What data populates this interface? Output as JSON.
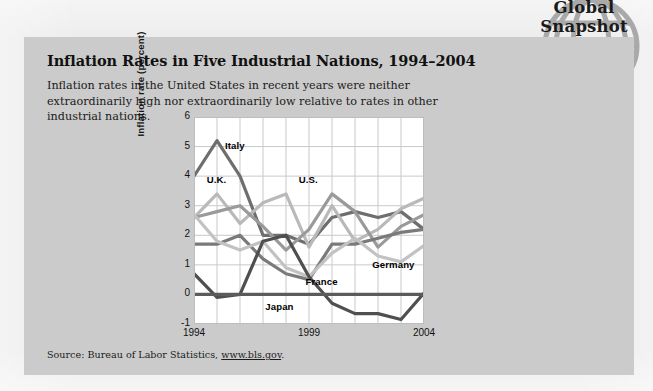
{
  "badge": {
    "line1": "Global",
    "line2": "Snapshot",
    "number": "12.5",
    "icon": "globe-icon",
    "color": "#a8a8a8"
  },
  "panel": {
    "title": "Inflation Rates in Five Industrial Nations, 1994–2004",
    "subtitle": "Inflation rates in the United States in recent years were neither extraordinarily high nor extraordinarily low relative to rates in other industrial nations.",
    "source_prefix": "Source: Bureau of Labor Statistics, ",
    "source_link": "www.bls.gov",
    "source_suffix": ".",
    "background": "#cbcbcb"
  },
  "chart_data": {
    "type": "line",
    "title": "Inflation Rates in Five Industrial Nations, 1994–2004",
    "xlabel": "",
    "ylabel": "Inflation rate (percent)",
    "x": [
      1994,
      1995,
      1996,
      1997,
      1998,
      1999,
      2000,
      2001,
      2002,
      2003,
      2004
    ],
    "xtick_labels": [
      "1994",
      "1999",
      "2004"
    ],
    "xtick_values": [
      1994,
      1999,
      2004
    ],
    "xlim": [
      1994,
      2004
    ],
    "ytick_labels": [
      "-1",
      "0",
      "1",
      "2",
      "3",
      "4",
      "5",
      "6"
    ],
    "ytick_values": [
      -1,
      0,
      1,
      2,
      3,
      4,
      5,
      6
    ],
    "ylim": [
      -1,
      6
    ],
    "grid": true,
    "legend": "inline-labels",
    "series": [
      {
        "name": "Italy",
        "color": "#6e6e6e",
        "width": 3.2,
        "label_x": 1995.35,
        "label_y": 5.0,
        "values": [
          4.0,
          5.2,
          4.0,
          2.0,
          2.0,
          1.7,
          2.6,
          2.8,
          2.6,
          2.8,
          2.2
        ]
      },
      {
        "name": "U.K.",
        "color": "#b9b9b9",
        "width": 3.2,
        "label_x": 1994.55,
        "label_y": 3.85,
        "values": [
          2.6,
          3.4,
          2.4,
          3.1,
          3.4,
          1.6,
          3.0,
          1.8,
          2.2,
          2.9,
          3.25
        ]
      },
      {
        "name": "U.S.",
        "color": "#9a9a9a",
        "width": 3.2,
        "label_x": 1998.55,
        "label_y": 3.85,
        "values": [
          2.6,
          2.8,
          3.0,
          2.3,
          1.5,
          2.2,
          3.4,
          2.8,
          1.6,
          2.3,
          2.7
        ]
      },
      {
        "name": "France",
        "color": "#7a7a7a",
        "width": 3.2,
        "label_x": 1998.85,
        "label_y": 0.38,
        "values": [
          1.7,
          1.7,
          2.0,
          1.2,
          0.7,
          0.5,
          1.7,
          1.7,
          1.9,
          2.1,
          2.2
        ]
      },
      {
        "name": "Germany",
        "color": "#c2c2c2",
        "width": 3.2,
        "label_x": 2001.75,
        "label_y": 0.95,
        "values": [
          2.7,
          1.8,
          1.5,
          1.8,
          0.9,
          0.6,
          1.4,
          1.9,
          1.3,
          1.1,
          1.65
        ]
      },
      {
        "name": "Japan",
        "color": "#4f4f4f",
        "width": 3.2,
        "label_x": 1997.1,
        "label_y": -0.45,
        "values": [
          0.7,
          -0.1,
          0.0,
          1.8,
          2.0,
          0.6,
          -0.3,
          -0.65,
          -0.65,
          -0.85,
          0.05
        ]
      }
    ],
    "zero_line": {
      "y": 0,
      "color": "#5b5b5b",
      "width": 3.2
    }
  }
}
